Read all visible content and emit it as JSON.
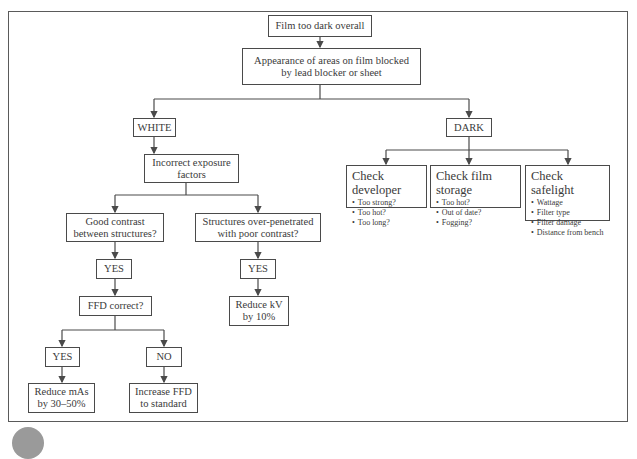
{
  "diagram": {
    "type": "flowchart",
    "nodes": {
      "root": "Film too dark overall",
      "q1_line1": "Appearance of areas on film blocked",
      "q1_line2": "by lead blocker or sheet",
      "white": "WHITE",
      "dark": "DARK",
      "exposure_line1": "Incorrect exposure",
      "exposure_line2": "factors",
      "good_contrast_line1": "Good contrast",
      "good_contrast_line2": "between structures?",
      "overpen_line1": "Structures over-penetrated",
      "overpen_line2": "with poor contrast?",
      "yes_left": "YES",
      "yes_right": "YES",
      "ffd": "FFD correct?",
      "yes_ffd": "YES",
      "no_ffd": "NO",
      "reduce_mas_line1": "Reduce mAs",
      "reduce_mas_line2": "by 30–50%",
      "increase_ffd_line1": "Increase FFD",
      "increase_ffd_line2": "to standard",
      "reduce_kv_line1": "Reduce kV",
      "reduce_kv_line2": "by 10%",
      "developer": {
        "title": "Check developer",
        "items": [
          "Too strong?",
          "Too hot?",
          "Too long?"
        ]
      },
      "storage": {
        "title": "Check film storage",
        "items": [
          "Too hot?",
          "Out of date?",
          "Fogging?"
        ]
      },
      "safelight": {
        "title": "Check safelight",
        "items": [
          "Wattage",
          "Filter type",
          "Filter damage",
          "Distance from bench"
        ]
      }
    },
    "edges": [
      [
        "root",
        "q1"
      ],
      [
        "q1",
        "white"
      ],
      [
        "q1",
        "dark"
      ],
      [
        "white",
        "exposure"
      ],
      [
        "exposure",
        "good_contrast"
      ],
      [
        "exposure",
        "overpen"
      ],
      [
        "good_contrast",
        "yes_left"
      ],
      [
        "yes_left",
        "ffd"
      ],
      [
        "ffd",
        "yes_ffd"
      ],
      [
        "ffd",
        "no_ffd"
      ],
      [
        "yes_ffd",
        "reduce_mas"
      ],
      [
        "no_ffd",
        "increase_ffd"
      ],
      [
        "overpen",
        "yes_right"
      ],
      [
        "yes_right",
        "reduce_kv"
      ],
      [
        "dark",
        "developer"
      ],
      [
        "dark",
        "storage"
      ],
      [
        "dark",
        "safelight"
      ]
    ],
    "colors": {
      "line": "#4a4a4a",
      "text": "#3a3a3a",
      "background": "#ffffff"
    }
  }
}
